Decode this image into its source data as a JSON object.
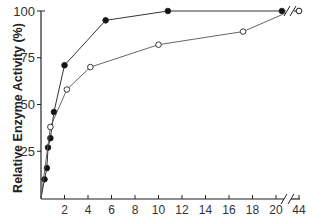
{
  "chart_data": {
    "type": "line",
    "title": "",
    "xlabel": "",
    "ylabel": "Relative Enzyme Activity (%)",
    "x_ticks": [
      "2",
      "4",
      "6",
      "8",
      "10",
      "12",
      "14",
      "16",
      "18",
      "20",
      "44"
    ],
    "y_ticks": [
      "25",
      "50",
      "75",
      "100"
    ],
    "xlim": [
      0,
      44
    ],
    "ylim": [
      0,
      100
    ],
    "x_axis_break": [
      20.5,
      43
    ],
    "grid": false,
    "legend": "none",
    "series": [
      {
        "name": "filled circles",
        "marker": "filled-circle",
        "x": [
          0,
          0.3,
          0.5,
          0.6,
          0.8,
          1.1,
          2.0,
          5.5,
          10.8,
          20.5,
          44
        ],
        "y": [
          0,
          10,
          16,
          27,
          32,
          46,
          71,
          95,
          100,
          100,
          100
        ]
      },
      {
        "name": "open circles",
        "marker": "open-circle",
        "x": [
          0,
          0.8,
          2.2,
          4.2,
          10.0,
          17.2,
          20.5,
          44
        ],
        "y": [
          0,
          38,
          58,
          70,
          82,
          89,
          98,
          100
        ]
      }
    ]
  },
  "labels": {
    "ylabel": "Relative Enzyme Activity (%)"
  }
}
